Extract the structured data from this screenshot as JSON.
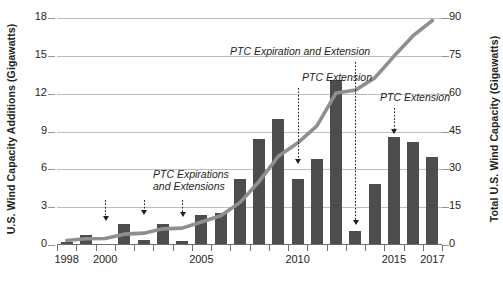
{
  "chart_data": {
    "type": "bar",
    "title": "",
    "xlabel": "",
    "ylabel": "U.S. Wind Capacity Additions (Gigawatts)",
    "y2label": "Total U.S. Wind Capacity (Gigawatts)",
    "grid": true,
    "legend": "none",
    "x": [
      1998,
      1999,
      2000,
      2001,
      2002,
      2003,
      2004,
      2005,
      2006,
      2007,
      2008,
      2009,
      2010,
      2011,
      2012,
      2013,
      2014,
      2015,
      2016,
      2017
    ],
    "categories": [
      "1998",
      "1999",
      "2000",
      "2001",
      "2002",
      "2003",
      "2004",
      "2005",
      "2006",
      "2007",
      "2008",
      "2009",
      "2010",
      "2011",
      "2012",
      "2013",
      "2014",
      "2015",
      "2016",
      "2017"
    ],
    "ylim": [
      0,
      18
    ],
    "yticks": [
      0,
      3,
      6,
      9,
      12,
      15,
      18
    ],
    "ytick_labels": [
      "0",
      "3",
      "6",
      "9",
      "12",
      "15",
      "18"
    ],
    "y2lim": [
      0,
      90
    ],
    "y2ticks": [
      0,
      15,
      30,
      45,
      60,
      75,
      90
    ],
    "y2tick_labels": [
      "0",
      "15",
      "30",
      "45",
      "60",
      "75",
      "90"
    ],
    "xtick_labels": [
      {
        "value": 1998,
        "label": "1998"
      },
      {
        "value": 2000,
        "label": "2000"
      },
      {
        "value": 2005,
        "label": "2005"
      },
      {
        "value": 2010,
        "label": "2010"
      },
      {
        "value": 2015,
        "label": "2015"
      },
      {
        "value": 2017,
        "label": "2017"
      }
    ],
    "series": [
      {
        "name": "U.S. Wind Capacity Additions",
        "type": "bar",
        "axis": "left",
        "color": "#4d4d4f",
        "values": [
          0.2,
          0.8,
          0.1,
          1.7,
          0.4,
          1.7,
          0.3,
          2.4,
          2.5,
          5.2,
          8.4,
          10.0,
          5.2,
          6.8,
          13.1,
          1.1,
          4.8,
          8.6,
          8.2,
          7.0
        ]
      },
      {
        "name": "Total U.S. Wind Capacity",
        "type": "line",
        "axis": "right",
        "color": "#8d8f91",
        "values": [
          1.8,
          2.5,
          2.6,
          4.3,
          4.7,
          6.4,
          6.7,
          9.1,
          11.6,
          16.8,
          25.2,
          35.2,
          40.4,
          47.2,
          60.3,
          61.4,
          66.2,
          74.8,
          83.0,
          89.0
        ]
      }
    ],
    "annotations": [
      {
        "id": "ptc-expirations-and-extensions",
        "text_lines": [
          "PTC Expirations",
          "and Extensions"
        ],
        "pointers": [
          2000,
          2002,
          2004
        ]
      },
      {
        "id": "ptc-extension-2010",
        "text_lines": [
          "PTC Extension"
        ],
        "pointers": [
          2010
        ]
      },
      {
        "id": "ptc-expiration-and-extension-2013",
        "text_lines": [
          "PTC Expiration and Extension"
        ],
        "pointers": [
          2013
        ]
      },
      {
        "id": "ptc-extension-2015",
        "text_lines": [
          "PTC Extension"
        ],
        "pointers": [
          2015
        ]
      }
    ]
  },
  "axes": {
    "left_title": "U.S. Wind Capacity Additions (Gigawatts)",
    "right_title": "Total U.S. Wind Capacity (Gigawatts)"
  },
  "annotation_text": {
    "a1_line1": "PTC Expirations",
    "a1_line2": "and Extensions",
    "a2": "PTC Extension",
    "a3": "PTC Expiration and Extension",
    "a4": "PTC Extension"
  },
  "colors": {
    "bar": "#4d4d4f",
    "line": "#8d8f91",
    "grid": "#bcbec0",
    "text": "#231f20"
  }
}
